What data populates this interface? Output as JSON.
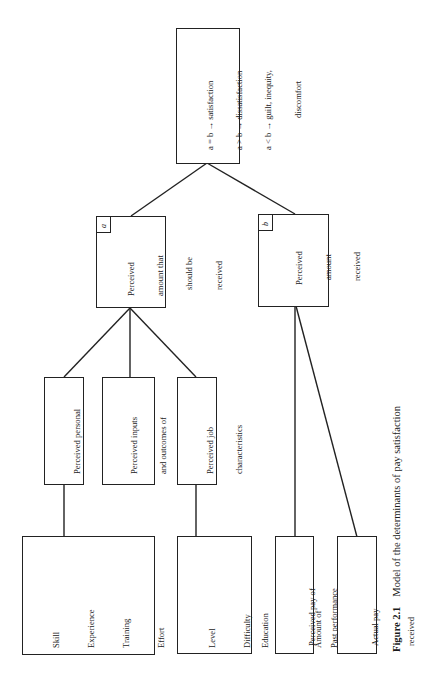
{
  "figure": {
    "caption_label": "Figure 2.1",
    "caption_text": "Model of the determinants of pay satisfaction",
    "orientation": "rotated 90° counter-clockwise"
  },
  "outcome_box": {
    "lines": [
      "a = b → satisfaction",
      "a > b → dissatisfaction",
      "a < b → guilt, inequity,",
      "discomfort"
    ]
  },
  "node_a": {
    "tag": "a",
    "lines": [
      "Perceived",
      "amount that",
      "should be",
      "received"
    ]
  },
  "node_b": {
    "tag": "b",
    "lines": [
      "Perceived",
      "amount",
      "received"
    ]
  },
  "middle_nodes": [
    {
      "lines": [
        "Perceived personal",
        "job inputs"
      ]
    },
    {
      "lines": [
        "Perceived inputs",
        "and outcomes of",
        "referent others"
      ]
    },
    {
      "lines": [
        "Perceived job",
        "characteristics"
      ]
    }
  ],
  "leaf_nodes": [
    {
      "lines": [
        "Skill",
        "Experience",
        "Training",
        "Effort",
        "Age",
        "Seniority",
        "Education",
        "Company loyalty",
        "Past performance",
        "Present performance"
      ]
    },
    {
      "lines": [
        "Level",
        "Difficulty",
        "Timespan",
        "Amount of",
        "responsibility"
      ]
    },
    {
      "lines": [
        "Perceived pay of",
        "referent others"
      ]
    },
    {
      "lines": [
        "Actual pay",
        "received"
      ]
    }
  ]
}
